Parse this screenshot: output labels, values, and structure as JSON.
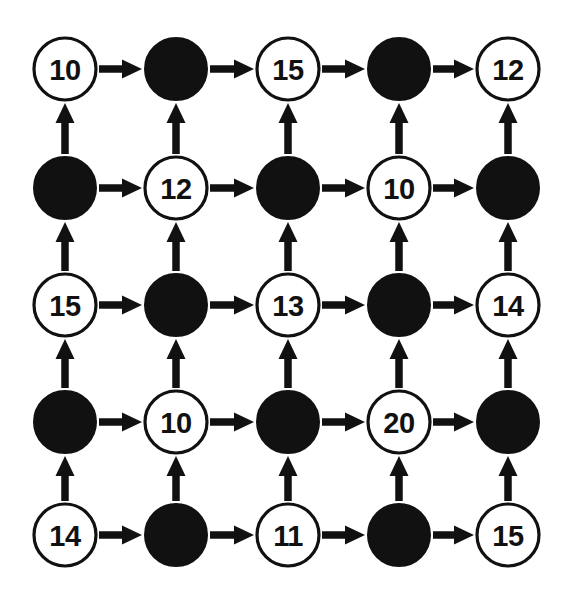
{
  "diagram": {
    "type": "grid-graph",
    "title": "",
    "width": 580,
    "height": 601,
    "background_color": "#ffffff",
    "node_fill_white": "#ffffff",
    "node_fill_black": "#111111",
    "stroke_color": "#111111",
    "node_radius": 31,
    "rows": 5,
    "columns": 5,
    "column_centers": [
      65,
      176,
      288,
      399,
      508
    ],
    "row_centers": [
      69,
      188,
      305,
      422,
      535
    ],
    "horizontal_edge_direction": "right",
    "vertical_edge_direction": "up",
    "grid": [
      [
        {
          "id": "r1c1",
          "type": "white",
          "label": "10",
          "row": 0,
          "col": 0
        },
        {
          "id": "r1c2",
          "type": "black",
          "label": "",
          "row": 0,
          "col": 1
        },
        {
          "id": "r1c3",
          "type": "white",
          "label": "15",
          "row": 0,
          "col": 2
        },
        {
          "id": "r1c4",
          "type": "black",
          "label": "",
          "row": 0,
          "col": 3
        },
        {
          "id": "r1c5",
          "type": "white",
          "label": "12",
          "row": 0,
          "col": 4
        }
      ],
      [
        {
          "id": "r2c1",
          "type": "black",
          "label": "",
          "row": 1,
          "col": 0
        },
        {
          "id": "r2c2",
          "type": "white",
          "label": "12",
          "row": 1,
          "col": 1
        },
        {
          "id": "r2c3",
          "type": "black",
          "label": "",
          "row": 1,
          "col": 2
        },
        {
          "id": "r2c4",
          "type": "white",
          "label": "10",
          "row": 1,
          "col": 3
        },
        {
          "id": "r2c5",
          "type": "black",
          "label": "",
          "row": 1,
          "col": 4
        }
      ],
      [
        {
          "id": "r3c1",
          "type": "white",
          "label": "15",
          "row": 2,
          "col": 0
        },
        {
          "id": "r3c2",
          "type": "black",
          "label": "",
          "row": 2,
          "col": 1
        },
        {
          "id": "r3c3",
          "type": "white",
          "label": "13",
          "row": 2,
          "col": 2
        },
        {
          "id": "r3c4",
          "type": "black",
          "label": "",
          "row": 2,
          "col": 3
        },
        {
          "id": "r3c5",
          "type": "white",
          "label": "14",
          "row": 2,
          "col": 4
        }
      ],
      [
        {
          "id": "r4c1",
          "type": "black",
          "label": "",
          "row": 3,
          "col": 0
        },
        {
          "id": "r4c2",
          "type": "white",
          "label": "10",
          "row": 3,
          "col": 1
        },
        {
          "id": "r4c3",
          "type": "black",
          "label": "",
          "row": 3,
          "col": 2
        },
        {
          "id": "r4c4",
          "type": "white",
          "label": "20",
          "row": 3,
          "col": 3
        },
        {
          "id": "r4c5",
          "type": "black",
          "label": "",
          "row": 3,
          "col": 4
        }
      ],
      [
        {
          "id": "r5c1",
          "type": "white",
          "label": "14",
          "row": 4,
          "col": 0
        },
        {
          "id": "r5c2",
          "type": "black",
          "label": "",
          "row": 4,
          "col": 1
        },
        {
          "id": "r5c3",
          "type": "white",
          "label": "11",
          "row": 4,
          "col": 2
        },
        {
          "id": "r5c4",
          "type": "black",
          "label": "",
          "row": 4,
          "col": 3
        },
        {
          "id": "r5c5",
          "type": "white",
          "label": "15",
          "row": 4,
          "col": 4
        }
      ]
    ],
    "labels_in_reading_order": [
      "10",
      "",
      "15",
      "",
      "12",
      "",
      "12",
      "",
      "10",
      "",
      "15",
      "",
      "13",
      "",
      "14",
      "",
      "10",
      "",
      "20",
      "",
      "14",
      "",
      "11",
      "",
      "15"
    ]
  }
}
